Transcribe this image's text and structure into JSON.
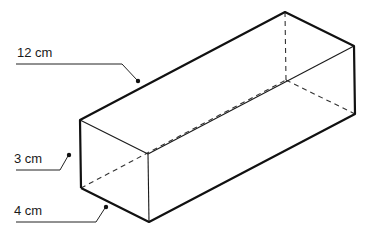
{
  "diagram": {
    "type": "rectangular-prism",
    "labels": {
      "length": "12 cm",
      "height": "3 cm",
      "width": "4 cm"
    },
    "colors": {
      "stroke": "#1a1a1a",
      "background": "#ffffff"
    }
  }
}
